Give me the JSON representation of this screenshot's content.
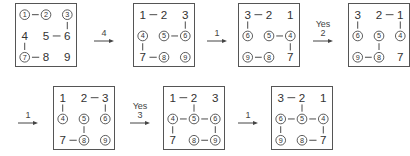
{
  "diagram": {
    "grids": [
      {
        "id": "g1",
        "pos": [
          15,
          3
        ],
        "cells": [
          [
            "1",
            "2",
            "3"
          ],
          [
            "4",
            "5",
            "6"
          ],
          [
            "7",
            "8",
            "9"
          ]
        ],
        "circled": [
          1,
          2,
          3,
          7
        ],
        "edges": [
          [
            1,
            2
          ],
          [
            3,
            6
          ],
          [
            5,
            6
          ],
          [
            4,
            7
          ],
          [
            7,
            8
          ]
        ]
      },
      {
        "id": "g2",
        "pos": [
          133,
          3
        ],
        "cells": [
          [
            "1",
            "2",
            "3"
          ],
          [
            "4",
            "5",
            "6"
          ],
          [
            "7",
            "8",
            "9"
          ]
        ],
        "circled": [
          4,
          5,
          6,
          8,
          9
        ],
        "edges": [
          [
            1,
            2
          ],
          [
            3,
            6
          ],
          [
            5,
            6
          ],
          [
            4,
            7
          ],
          [
            7,
            8
          ]
        ]
      },
      {
        "id": "g3",
        "pos": [
          238,
          3
        ],
        "cells": [
          [
            "3",
            "2",
            "1"
          ],
          [
            "6",
            "5",
            "4"
          ],
          [
            "9",
            "8",
            "7"
          ]
        ],
        "circled": [
          6,
          5,
          4,
          9,
          8
        ],
        "edges": [
          [
            3,
            2
          ],
          [
            3,
            6
          ],
          [
            5,
            4
          ],
          [
            4,
            7
          ],
          [
            9,
            8
          ]
        ]
      },
      {
        "id": "g4",
        "pos": [
          348,
          3
        ],
        "cells": [
          [
            "3",
            "2",
            "1"
          ],
          [
            "6",
            "5",
            "4"
          ],
          [
            "9",
            "8",
            "7"
          ]
        ],
        "circled": [
          6,
          5,
          4,
          9,
          8
        ],
        "edges": [
          [
            2,
            1
          ],
          [
            3,
            6
          ],
          [
            1,
            4
          ],
          [
            5,
            8
          ],
          [
            9,
            8
          ]
        ]
      },
      {
        "id": "g5",
        "pos": [
          53,
          86
        ],
        "cells": [
          [
            "1",
            "2",
            "3"
          ],
          [
            "4",
            "5",
            "6"
          ],
          [
            "7",
            "8",
            "9"
          ]
        ],
        "circled": [
          4,
          5,
          6,
          8,
          9
        ],
        "edges": [
          [
            2,
            3
          ],
          [
            1,
            4
          ],
          [
            3,
            6
          ],
          [
            5,
            8
          ],
          [
            7,
            8
          ]
        ]
      },
      {
        "id": "g6",
        "pos": [
          163,
          86
        ],
        "cells": [
          [
            "1",
            "2",
            "3"
          ],
          [
            "4",
            "5",
            "6"
          ],
          [
            "7",
            "8",
            "9"
          ]
        ],
        "circled": [
          4,
          5,
          6,
          8,
          9
        ],
        "edges": [
          [
            1,
            2
          ],
          [
            2,
            5
          ],
          [
            4,
            5
          ],
          [
            5,
            6
          ],
          [
            4,
            7
          ],
          [
            6,
            9
          ],
          [
            8,
            9
          ]
        ]
      },
      {
        "id": "g7",
        "pos": [
          271,
          86
        ],
        "cells": [
          [
            "3",
            "2",
            "1"
          ],
          [
            "6",
            "5",
            "4"
          ],
          [
            "9",
            "8",
            "7"
          ]
        ],
        "circled": [
          6,
          5,
          4,
          9,
          8
        ],
        "edges": [
          [
            3,
            2
          ],
          [
            2,
            5
          ],
          [
            6,
            5
          ],
          [
            5,
            4
          ],
          [
            6,
            9
          ],
          [
            4,
            7
          ],
          [
            8,
            7
          ]
        ]
      }
    ],
    "arrows": [
      {
        "id": "a1",
        "pos": [
          93,
          22
        ],
        "top_label": "",
        "label": "4"
      },
      {
        "id": "a2",
        "pos": [
          206,
          22
        ],
        "top_label": "",
        "label": "1"
      },
      {
        "id": "a3",
        "pos": [
          312,
          22
        ],
        "top_label": "Yes",
        "label": "2"
      },
      {
        "id": "a4",
        "pos": [
          17,
          104
        ],
        "top_label": "",
        "label": "1"
      },
      {
        "id": "a5",
        "pos": [
          129,
          104
        ],
        "top_label": "Yes",
        "label": "3"
      },
      {
        "id": "a6",
        "pos": [
          237,
          104
        ],
        "top_label": "",
        "label": "1"
      }
    ]
  }
}
